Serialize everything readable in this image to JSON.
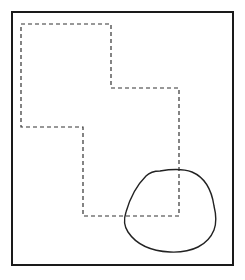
{
  "diagram": {
    "background": "#ffffff",
    "stroke_color": "#1a1a1a",
    "dashed_color": "#333333",
    "frame": {
      "x": 12,
      "y": 12,
      "width": 221,
      "height": 253,
      "stroke_width": 2
    },
    "dashed_region": {
      "points": "21,24 111,24 111,88 179,88 179,216 83,216 83,127 21,127",
      "dash": "4 3"
    },
    "blob": {
      "path": "M 160 171 C 172 169 184 169 192 172 C 206 178 212 192 214 206 C 216 214 217 222 214 230 C 208 245 192 253 170 252 C 150 251 136 244 128 232 C 124 226 124 218 126 212 C 130 198 138 184 146 176 C 150 172 155 171 160 171 Z"
    }
  }
}
